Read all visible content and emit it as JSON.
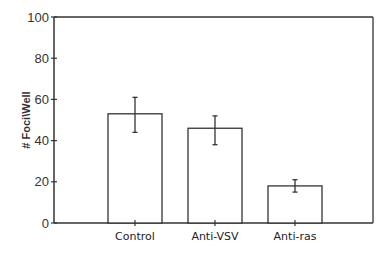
{
  "chart_data": {
    "type": "bar",
    "title": "",
    "xlabel": "",
    "ylabel": "# Foci\\Well",
    "ylim": [
      0,
      100
    ],
    "yticks": [
      0,
      20,
      40,
      60,
      80,
      100
    ],
    "grid": false,
    "legend": null,
    "categories": [
      "Control",
      "Anti-VSV",
      "Anti-ras"
    ],
    "values": [
      53,
      46,
      18
    ],
    "error_bars": [
      {
        "low": 44,
        "high": 61
      },
      {
        "low": 38,
        "high": 52
      },
      {
        "low": 15,
        "high": 21
      }
    ]
  }
}
